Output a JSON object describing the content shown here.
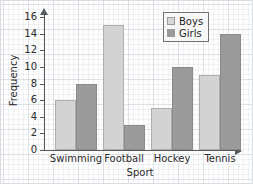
{
  "chart_data": {
    "type": "bar",
    "title": "",
    "xlabel": "Sport",
    "ylabel": "Frequency",
    "categories": [
      "Swimming",
      "Football",
      "Hockey",
      "Tennis"
    ],
    "series": [
      {
        "name": "Boys",
        "values": [
          6,
          15,
          5,
          9
        ],
        "color": "#d3d3d3"
      },
      {
        "name": "Girls",
        "values": [
          8,
          3,
          10,
          14
        ],
        "color": "#9b9b9b"
      }
    ],
    "ylim": [
      0,
      16
    ],
    "ytick_values": [
      0,
      2,
      4,
      6,
      8,
      10,
      12,
      14,
      16
    ],
    "ytick_labels": [
      "0",
      "2",
      "4",
      "6",
      "8",
      "10",
      "12",
      "14",
      "16"
    ],
    "grid": true,
    "grid_style": "graph-paper",
    "legend_position": "top-right",
    "axis_arrows": true
  },
  "legend": {
    "entries": [
      {
        "label": "Boys",
        "swatch": "legend-swatch-boys"
      },
      {
        "label": "Girls",
        "swatch": "legend-swatch-girls"
      }
    ]
  },
  "axes": {
    "y_title": "Frequency",
    "x_title": "Sport"
  },
  "colors": {
    "boys": "#d3d3d3",
    "girls": "#9b9b9b",
    "axis": "#55585c",
    "text": "#2b2b2b",
    "grid_minor": "rgba(150,160,175,0.11)",
    "grid_major": "rgba(150,160,175,0.20)"
  }
}
